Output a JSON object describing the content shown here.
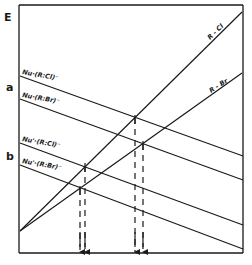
{
  "diagram": {
    "axis_label": "E",
    "panel_labels": {
      "a": "a",
      "b": "b"
    },
    "bond_lines": [
      {
        "label": "R - Cl",
        "from": [
          20,
          231
        ],
        "to": [
          242,
          12
        ]
      },
      {
        "label": "R - Br",
        "from": [
          20,
          231
        ],
        "to": [
          242,
          73
        ]
      }
    ],
    "complex_lines": [
      {
        "label": "Nu·(R:Cl)⁻",
        "from": [
          20,
          76
        ],
        "to": [
          243,
          156
        ]
      },
      {
        "label": "Nu·(R:Br)⁻",
        "from": [
          20,
          99
        ],
        "to": [
          243,
          180
        ]
      },
      {
        "label": "Nu'·(R:Cl)⁻",
        "from": [
          20,
          143
        ],
        "to": [
          243,
          225
        ]
      },
      {
        "label": "Nu'·(R:Br)⁻",
        "from": [
          20,
          165
        ],
        "to": [
          243,
          249
        ]
      }
    ],
    "crossings": [
      {
        "pair": "a: R-Cl × Nu·(R:Cl)⁻",
        "point": [
          135,
          118
        ]
      },
      {
        "pair": "a: R-Br × Nu·(R:Br)⁻",
        "point": [
          143,
          144
        ]
      },
      {
        "pair": "b: R-Cl × Nu'·(R:Cl)⁻",
        "point": [
          85,
          166
        ]
      },
      {
        "pair": "b: R-Br × Nu'·(R:Br)⁻",
        "point": [
          80,
          189
        ]
      }
    ],
    "colors": {
      "ink": "#1a1a1a",
      "background": "#ffffff"
    }
  }
}
